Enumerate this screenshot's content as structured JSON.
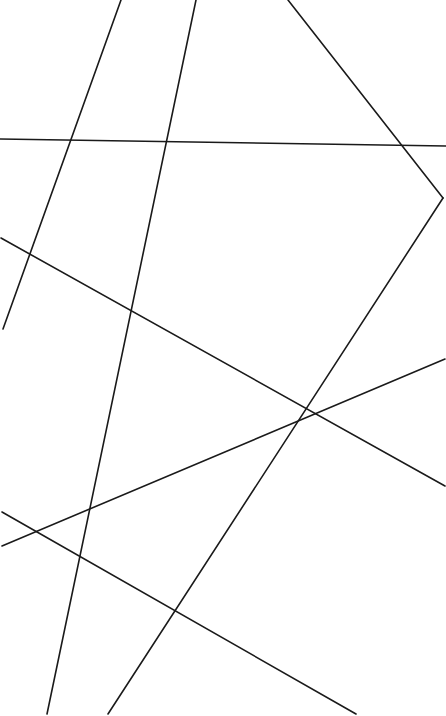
{
  "figure": {
    "type": "line-arrangement",
    "width": 446,
    "height": 716,
    "background_color": "#ffffff",
    "stroke_color": "#1a1a1a",
    "stroke_width": 1.6,
    "line_cap": "round",
    "antialias": true
  },
  "chart_data": {
    "type": "line",
    "title": "",
    "subtitle": "",
    "xlabel": "",
    "ylabel": "",
    "grid": false,
    "legend": false,
    "legend_position": "none",
    "xlim": [
      0,
      446
    ],
    "ylim": [
      0,
      716
    ],
    "coordinate_system": "pixel-top-left",
    "series": [
      {
        "name": "segment-1-near-horizontal",
        "stroke": "#1a1a1a",
        "x": [
          0,
          446
        ],
        "y": [
          139,
          146
        ]
      },
      {
        "name": "segment-2-steep-left-descending",
        "stroke": "#1a1a1a",
        "x": [
          121,
          3
        ],
        "y": [
          0,
          329
        ]
      },
      {
        "name": "segment-3-long-left-descending",
        "stroke": "#1a1a1a",
        "x": [
          196,
          47
        ],
        "y": [
          0,
          714
        ]
      },
      {
        "name": "segment-4-top-to-right-edge",
        "stroke": "#1a1a1a",
        "x": [
          288,
          443
        ],
        "y": [
          0,
          198
        ]
      },
      {
        "name": "segment-5-right-edge-to-bottom",
        "stroke": "#1a1a1a",
        "x": [
          443,
          108
        ],
        "y": [
          198,
          714
        ]
      },
      {
        "name": "segment-6-left-mid-to-right-low",
        "stroke": "#1a1a1a",
        "x": [
          1,
          445
        ],
        "y": [
          238,
          486
        ]
      },
      {
        "name": "segment-7-left-low-to-bottom-right",
        "stroke": "#1a1a1a",
        "x": [
          2,
          356
        ],
        "y": [
          512,
          714
        ]
      },
      {
        "name": "segment-8-left-low-ascending-to-right",
        "stroke": "#1a1a1a",
        "x": [
          2,
          445
        ],
        "y": [
          546,
          359
        ]
      }
    ],
    "intersections": [
      {
        "name": "hub-center",
        "x": 295,
        "y": 420,
        "lines": [
          "segment-5-right-edge-to-bottom",
          "segment-6-left-mid-to-right-low",
          "segment-8-left-low-ascending-to-right"
        ]
      },
      {
        "name": "top-cross",
        "x": 232,
        "y": 130,
        "lines": [
          "segment-3-long-left-descending",
          "segment-4-top-to-right-edge"
        ]
      },
      {
        "name": "left-cross",
        "x": 35,
        "y": 530,
        "lines": [
          "segment-7-left-low-to-bottom-right",
          "segment-8-left-low-ascending-to-right"
        ]
      },
      {
        "name": "lower-cross",
        "x": 178,
        "y": 614,
        "lines": [
          "segment-3-long-left-descending",
          "segment-7-left-low-to-bottom-right"
        ]
      },
      {
        "name": "upper-left-cross",
        "x": 44,
        "y": 268,
        "lines": [
          "segment-2-steep-left-descending",
          "segment-6-left-mid-to-right-low"
        ]
      },
      {
        "name": "horizontal-cross-a",
        "x": 59,
        "y": 140,
        "lines": [
          "segment-1-near-horizontal",
          "segment-2-steep-left-descending"
        ]
      },
      {
        "name": "horizontal-cross-b",
        "x": 166,
        "y": 142,
        "lines": [
          "segment-1-near-horizontal",
          "segment-3-long-left-descending"
        ]
      },
      {
        "name": "horizontal-cross-c",
        "x": 396,
        "y": 144,
        "lines": [
          "segment-1-near-horizontal",
          "segment-4-top-to-right-edge"
        ]
      }
    ],
    "annotations": []
  }
}
